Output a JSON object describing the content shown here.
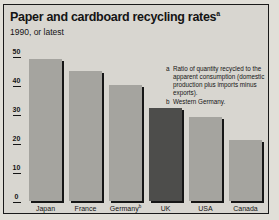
{
  "header": {
    "title": "Paper and cardboard recycling rates",
    "title_note_marker": "a",
    "subtitle": "1990, or latest"
  },
  "chart_data": {
    "type": "bar",
    "title": "Paper and cardboard recycling rates",
    "subtitle": "1990, or latest",
    "categories": [
      "Japan",
      "France",
      "Germany",
      "UK",
      "USA",
      "Canada"
    ],
    "values": [
      49,
      45,
      40,
      32,
      29,
      21
    ],
    "xlabel": "",
    "ylabel": "",
    "ylim": [
      0,
      50
    ],
    "y_ticks": [
      50,
      40,
      30,
      20,
      10,
      0
    ],
    "grid": false,
    "legend": "none",
    "bars": [
      {
        "label": "Japan",
        "superscript": "",
        "value": 49,
        "color": "#a5a49f"
      },
      {
        "label": "France",
        "superscript": "",
        "value": 45,
        "color": "#a5a49f"
      },
      {
        "label": "Germany",
        "superscript": "b",
        "value": 40,
        "color": "#a5a49f"
      },
      {
        "label": "UK",
        "superscript": "",
        "value": 32,
        "color": "#4d4d4b"
      },
      {
        "label": "USA",
        "superscript": "",
        "value": 29,
        "color": "#a5a49f"
      },
      {
        "label": "Canada",
        "superscript": "",
        "value": 21,
        "color": "#a5a49f"
      }
    ]
  },
  "footnotes": [
    {
      "marker": "a",
      "text": "Ratio of quantity recycled to the apparent consumption (domestic production plus imports minus exports)."
    },
    {
      "marker": "b",
      "text": "Western Germany."
    }
  ],
  "colors": {
    "paper_bg": "#e1dfd8",
    "panel_bg": "#d8d6d0",
    "bar": "#a5a49f",
    "bar_highlight": "#4d4d4b",
    "bar_shadow": "#161616",
    "text": "#141414",
    "frame_border": "#1a1a1a"
  }
}
